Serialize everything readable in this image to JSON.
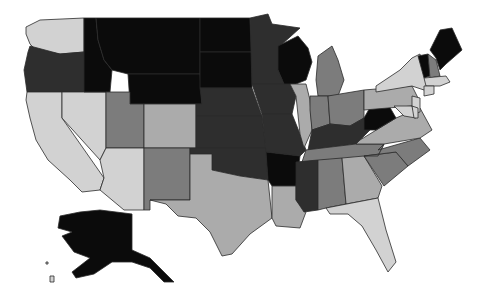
{
  "map": {
    "type": "choropleth",
    "region": "United States",
    "shade_levels": {
      "1": "#d2d2d2",
      "2": "#ababab",
      "3": "#7c7c7c",
      "4": "#2e2e2e",
      "5": "#0b0b0b"
    },
    "states": [
      {
        "id": "WA",
        "level": 1,
        "points": "26,27 40,20 84,18 84,52 60,54 36,50 30,44 26,34"
      },
      {
        "id": "OR",
        "level": 4,
        "points": "30,46 60,54 84,52 84,92 27,92 24,70 28,52"
      },
      {
        "id": "CA",
        "level": 1,
        "points": "27,92 62,92 62,118 104,178 100,190 82,192 70,180 48,160 36,140 30,118 26,100"
      },
      {
        "id": "NV",
        "level": 1,
        "points": "62,92 106,92 106,148 100,160 62,118"
      },
      {
        "id": "ID",
        "level": 5,
        "points": "84,18 96,18 98,40 104,60 112,70 110,92 84,92"
      },
      {
        "id": "MT",
        "level": 5,
        "points": "96,18 200,18 200,74 128,74 112,70 104,60 98,40"
      },
      {
        "id": "WY",
        "level": 5,
        "points": "128,74 200,74 202,104 130,104"
      },
      {
        "id": "UT",
        "level": 3,
        "points": "106,92 130,92 130,104 144,104 144,148 106,148"
      },
      {
        "id": "AZ",
        "level": 1,
        "points": "106,148 144,148 144,210 124,210 100,190 104,178 100,160"
      },
      {
        "id": "CO",
        "level": 2,
        "points": "144,104 196,104 196,148 144,148"
      },
      {
        "id": "NM",
        "level": 3,
        "points": "144,148 190,148 190,200 150,200 150,210 144,210"
      },
      {
        "id": "ND",
        "level": 5,
        "points": "200,18 250,18 252,52 200,52"
      },
      {
        "id": "SD",
        "level": 5,
        "points": "200,52 252,52 252,88 200,88"
      },
      {
        "id": "NE",
        "level": 4,
        "points": "200,88 252,88 262,116 196,116 196,104 202,104"
      },
      {
        "id": "KS",
        "level": 4,
        "points": "196,116 262,116 266,148 196,148"
      },
      {
        "id": "OK",
        "level": 4,
        "points": "190,148 266,148 268,180 240,176 212,170 212,154 190,154"
      },
      {
        "id": "TX",
        "level": 2,
        "points": "190,154 212,154 212,170 240,176 268,180 272,218 250,234 232,254 222,256 210,232 196,218 178,216 166,204 150,200 190,200"
      },
      {
        "id": "MN",
        "level": 4,
        "points": "250,18 268,14 272,24 300,28 280,46 278,70 284,84 252,84"
      },
      {
        "id": "IA",
        "level": 4,
        "points": "252,84 290,84 296,96 292,114 262,114"
      },
      {
        "id": "MO",
        "level": 4,
        "points": "262,114 292,114 300,134 306,150 300,156 266,152"
      },
      {
        "id": "AR",
        "level": 5,
        "points": "266,152 300,156 296,186 272,186 268,180"
      },
      {
        "id": "LA",
        "level": 2,
        "points": "272,186 296,186 296,200 306,212 300,228 276,226 272,218"
      },
      {
        "id": "WI",
        "level": 5,
        "points": "278,46 298,36 308,48 312,62 306,80 296,84 284,84 278,70"
      },
      {
        "id": "IL",
        "level": 2,
        "points": "290,84 306,84 310,100 312,130 304,148 300,134 296,96"
      },
      {
        "id": "MI",
        "level": 3,
        "points": "318,56 332,46 338,60 344,80 338,96 318,96 316,80"
      },
      {
        "id": "IN",
        "level": 3,
        "points": "310,96 328,96 330,124 312,130 310,110"
      },
      {
        "id": "OH",
        "level": 3,
        "points": "328,96 364,90 364,118 350,126 330,124"
      },
      {
        "id": "KY",
        "level": 4,
        "points": "312,130 330,124 350,126 364,118 372,128 356,144 308,150"
      },
      {
        "id": "TN",
        "level": 3,
        "points": "306,150 356,144 384,144 378,156 302,162"
      },
      {
        "id": "MS",
        "level": 4,
        "points": "296,162 318,160 318,210 304,212 296,200"
      },
      {
        "id": "AL",
        "level": 3,
        "points": "318,160 342,158 346,204 326,208 318,210"
      },
      {
        "id": "GA",
        "level": 2,
        "points": "342,158 364,156 382,186 378,198 346,204"
      },
      {
        "id": "FL",
        "level": 1,
        "points": "326,208 378,198 386,230 396,262 388,272 376,250 362,226 348,214 330,214"
      },
      {
        "id": "SC",
        "level": 3,
        "points": "364,156 396,152 408,166 384,186"
      },
      {
        "id": "NC",
        "level": 3,
        "points": "378,150 420,138 430,150 408,166 396,152 364,156 378,156 384,144"
      },
      {
        "id": "VA",
        "level": 2,
        "points": "360,140 396,118 420,108 432,130 420,138 384,144 356,144"
      },
      {
        "id": "WV",
        "level": 5,
        "points": "364,118 372,104 388,104 396,118 376,130 364,130"
      },
      {
        "id": "PA",
        "level": 2,
        "points": "364,90 412,86 418,98 412,106 364,110"
      },
      {
        "id": "NY",
        "level": 1,
        "points": "376,86 400,70 412,58 420,54 426,80 430,92 412,86 376,92"
      },
      {
        "id": "VT",
        "level": 5,
        "points": "418,56 428,54 430,76 424,78"
      },
      {
        "id": "NH",
        "level": 3,
        "points": "428,54 436,60 440,76 430,78"
      },
      {
        "id": "ME",
        "level": 5,
        "points": "430,50 440,30 452,28 462,50 446,64 440,70 436,58"
      },
      {
        "id": "MA",
        "level": 1,
        "points": "424,78 446,76 450,82 440,86 426,86"
      },
      {
        "id": "CT",
        "level": 1,
        "points": "424,86 434,86 434,94 424,96"
      },
      {
        "id": "NJ",
        "level": 1,
        "points": "412,96 420,98 420,112 412,114"
      },
      {
        "id": "MD",
        "level": 1,
        "points": "394,106 412,106 416,118 404,116"
      },
      {
        "id": "DE",
        "level": 1,
        "points": "412,106 418,108 418,118 414,118"
      },
      {
        "id": "AK",
        "level": 5,
        "points": "60,216 80,212 100,210 132,214 132,250 150,258 174,282 164,282 150,268 132,262 112,262 94,274 76,278 72,272 90,258 74,252 62,236 72,232 58,228"
      },
      {
        "id": "HI1",
        "level": 1,
        "points": "50,276 54,276 54,282 50,282"
      },
      {
        "id": "HI2",
        "level": 1,
        "points": "46,262 48,262 48,264 46,264"
      }
    ]
  }
}
